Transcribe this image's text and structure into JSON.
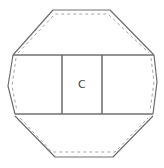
{
  "diagram": {
    "shape": "octagonal-solid-with-center-band",
    "cells": [
      {
        "id": "left",
        "label": ""
      },
      {
        "id": "center",
        "label": "C"
      },
      {
        "id": "right",
        "label": ""
      }
    ],
    "colors": {
      "stroke": "#6e6e6e",
      "dashed_stroke": "#9a9a9a",
      "background": "#ffffff",
      "label": "#444444"
    }
  }
}
